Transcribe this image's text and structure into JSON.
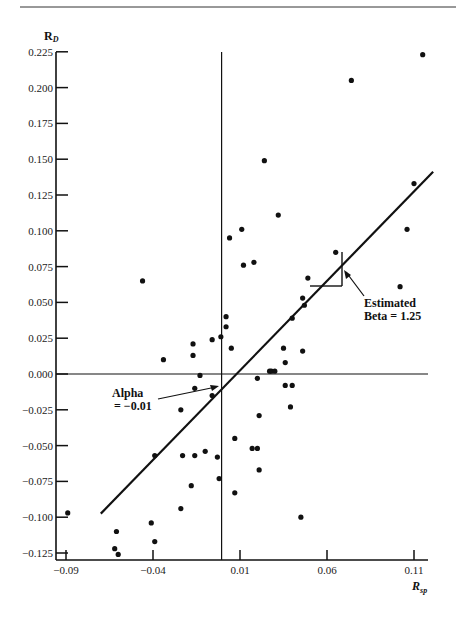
{
  "chart_data": {
    "type": "scatter",
    "title": "",
    "xlabel": "R_sp",
    "ylabel": "R_D",
    "xlim": [
      -0.09,
      0.12
    ],
    "ylim": [
      -0.125,
      0.225
    ],
    "x_ticks": [
      -0.09,
      -0.04,
      0.01,
      0.06,
      0.11
    ],
    "x_tick_labels": [
      "-0.09",
      "-0.04",
      "0.01",
      "0.06",
      "0.11"
    ],
    "y_ticks": [
      0.225,
      0.2,
      0.175,
      0.15,
      0.125,
      0.1,
      0.075,
      0.05,
      0.025,
      0.0,
      -0.025,
      -0.05,
      -0.075,
      -0.1,
      -0.125
    ],
    "y_tick_labels": [
      "0.225",
      "0.200",
      "0.175",
      "0.150",
      "0.125",
      "0.100",
      "0.075",
      "0.050",
      "0.025",
      "0.000",
      "-0.025",
      "-0.050",
      "-0.075",
      "-0.100",
      "-0.125"
    ],
    "grid": false,
    "legend": null,
    "reference_lines": {
      "vertical_x": 0.0,
      "horizontal_y": 0.0
    },
    "regression_line": {
      "alpha": -0.01,
      "beta": 1.25,
      "x_start": -0.07,
      "x_end": 0.121
    },
    "annotations": [
      {
        "text_lines": [
          "Alpha",
          "= -0.01"
        ],
        "points_to": [
          0.0,
          -0.01
        ]
      },
      {
        "text_lines": [
          "Estimated",
          "Beta = 1.25"
        ],
        "points_to": [
          0.07,
          0.075
        ]
      }
    ],
    "points": [
      [
        -0.089,
        -0.097
      ],
      [
        -0.061,
        -0.11
      ],
      [
        -0.062,
        -0.122
      ],
      [
        -0.06,
        -0.126
      ],
      [
        -0.041,
        -0.104
      ],
      [
        -0.039,
        -0.117
      ],
      [
        -0.039,
        -0.057
      ],
      [
        -0.046,
        0.065
      ],
      [
        -0.034,
        0.01
      ],
      [
        -0.024,
        -0.025
      ],
      [
        -0.023,
        -0.057
      ],
      [
        -0.016,
        -0.057
      ],
      [
        -0.024,
        -0.094
      ],
      [
        -0.018,
        -0.078
      ],
      [
        -0.01,
        -0.054
      ],
      [
        -0.003,
        -0.058
      ],
      [
        -0.002,
        -0.073
      ],
      [
        -0.017,
        0.021
      ],
      [
        -0.017,
        0.013
      ],
      [
        -0.013,
        -0.001
      ],
      [
        -0.016,
        -0.01
      ],
      [
        -0.006,
        -0.015
      ],
      [
        -0.006,
        0.024
      ],
      [
        -0.001,
        0.026
      ],
      [
        0.002,
        0.033
      ],
      [
        0.002,
        0.04
      ],
      [
        0.005,
        0.018
      ],
      [
        0.004,
        0.095
      ],
      [
        0.011,
        0.101
      ],
      [
        0.012,
        0.076
      ],
      [
        0.018,
        0.078
      ],
      [
        0.024,
        0.149
      ],
      [
        0.032,
        0.111
      ],
      [
        0.074,
        0.205
      ],
      [
        0.115,
        0.223
      ],
      [
        0.11,
        0.133
      ],
      [
        0.106,
        0.101
      ],
      [
        0.102,
        0.061
      ],
      [
        0.065,
        0.085
      ],
      [
        0.049,
        0.067
      ],
      [
        0.046,
        0.053
      ],
      [
        0.047,
        0.048
      ],
      [
        0.04,
        0.039
      ],
      [
        0.035,
        0.018
      ],
      [
        0.046,
        0.016
      ],
      [
        0.036,
        0.008
      ],
      [
        0.027,
        0.002
      ],
      [
        0.028,
        0.002
      ],
      [
        0.03,
        0.002
      ],
      [
        0.02,
        -0.003
      ],
      [
        0.036,
        -0.008
      ],
      [
        0.04,
        -0.008
      ],
      [
        0.039,
        -0.023
      ],
      [
        0.021,
        -0.029
      ],
      [
        0.045,
        -0.1
      ],
      [
        0.007,
        -0.045
      ],
      [
        0.007,
        -0.083
      ],
      [
        0.017,
        -0.052
      ],
      [
        0.02,
        -0.052
      ],
      [
        0.021,
        -0.067
      ]
    ]
  },
  "labels": {
    "y_axis_main": "R",
    "y_axis_sub": "D",
    "x_axis_main": "R",
    "x_axis_sub": "sp",
    "alpha_line1": "Alpha",
    "alpha_line2": "= −0.01",
    "beta_line1": "Estimated",
    "beta_line2": "Beta = 1.25"
  },
  "colors": {
    "ink": "#111111",
    "background": "#ffffff"
  }
}
